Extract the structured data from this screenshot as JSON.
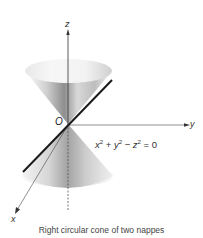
{
  "figure": {
    "axes": {
      "z_label": "z",
      "y_label": "y",
      "x_label": "x",
      "origin_label": "O"
    },
    "equation": {
      "x_term": "x",
      "y_term": "y",
      "z_term": "z",
      "exp": "2",
      "plus": " + ",
      "minus": " − ",
      "rhs": " = 0"
    },
    "caption": "Right circular cone of two nappes",
    "colors": {
      "background": "#ffffff",
      "axis": "#333333",
      "generator_line": "#1a1a1a",
      "cone_light": "#f2f2f2",
      "cone_dark": "#8a8a8a"
    }
  }
}
